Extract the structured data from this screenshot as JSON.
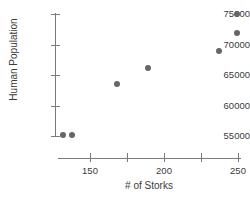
{
  "chart_data": {
    "type": "scatter",
    "title": "",
    "xlabel": "# of Storks",
    "ylabel": "Human Population",
    "xlim": [
      130,
      252
    ],
    "ylim": [
      54000,
      75800
    ],
    "grid": false,
    "legend": null,
    "marker_color": "#666666",
    "axis_color": "#7a7a7a",
    "xticks": [
      150,
      175,
      200,
      225,
      250
    ],
    "xtick_labels": [
      "150",
      "",
      "200",
      "",
      "250"
    ],
    "yticks": [
      55000,
      60000,
      65000,
      70000,
      75000
    ],
    "ytick_labels": [
      "55000",
      "60000",
      "65000",
      "70000",
      "75000"
    ],
    "points": [
      {
        "x": 132,
        "y": 55200
      },
      {
        "x": 138,
        "y": 55200
      },
      {
        "x": 168,
        "y": 63500
      },
      {
        "x": 189,
        "y": 66100
      },
      {
        "x": 237,
        "y": 68900
      },
      {
        "x": 249,
        "y": 71900
      },
      {
        "x": 249,
        "y": 75000
      }
    ]
  }
}
